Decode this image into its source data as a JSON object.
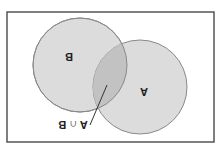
{
  "diagram": {
    "type": "venn",
    "orientation": "rotated-180",
    "frame": {
      "x": 7,
      "y": 12,
      "width": 207,
      "height": 130,
      "stroke": "#555555"
    },
    "sets": [
      {
        "id": "A",
        "label": "A",
        "cx": 140,
        "cy": 87,
        "r": 47,
        "fill": "#dcdcdc",
        "stroke": "#8a8a8a",
        "label_x": 144,
        "label_y": 92
      },
      {
        "id": "B",
        "label": "B",
        "cx": 80,
        "cy": 65,
        "r": 47,
        "fill": "#dcdcdc",
        "stroke": "#8a8a8a",
        "label_x": 69,
        "label_y": 57
      }
    ],
    "intersection": {
      "label": "A ∩ B",
      "fill": "#c2c2c2",
      "pointer": {
        "x1": 107,
        "y1": 85,
        "x2": 90,
        "y2": 125
      },
      "label_x": 72,
      "label_y": 127
    }
  }
}
